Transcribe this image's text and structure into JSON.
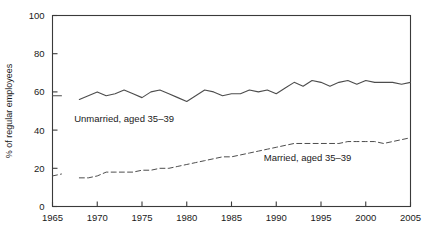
{
  "chart_data": {
    "type": "line",
    "title": "",
    "xlabel": "",
    "ylabel": "% of regular employees",
    "xlim": [
      1965,
      2005
    ],
    "ylim": [
      0,
      100
    ],
    "xticks": [
      1965,
      1970,
      1975,
      1980,
      1985,
      1990,
      1995,
      2000,
      2005
    ],
    "yticks": [
      0,
      20,
      40,
      60,
      80,
      100
    ],
    "grid": false,
    "legend_position": "inline-annotations",
    "annotations": [
      {
        "text": "Unmarried, aged 35–39",
        "x": 1973.0,
        "y": 44.0,
        "series": "unmarried"
      },
      {
        "text": "Married, aged 35–39",
        "x": 1993.5,
        "y": 24.0,
        "series": "married"
      }
    ],
    "series": [
      {
        "name": "Unmarried, aged 35–39",
        "style": "solid",
        "color": "#4d4d4d",
        "x": [
          1965,
          1966,
          1968,
          1969,
          1970,
          1971,
          1972,
          1973,
          1974,
          1975,
          1976,
          1977,
          1978,
          1979,
          1980,
          1981,
          1982,
          1983,
          1984,
          1985,
          1986,
          1987,
          1988,
          1989,
          1990,
          1991,
          1992,
          1993,
          1994,
          1995,
          1996,
          1997,
          1998,
          1999,
          2000,
          2001,
          2002,
          2003,
          2004,
          2005
        ],
        "values": [
          58,
          58,
          56,
          58,
          60,
          58,
          59,
          61,
          59,
          57,
          60,
          61,
          59,
          57,
          55,
          58,
          61,
          60,
          58,
          59,
          59,
          61,
          60,
          61,
          59,
          62,
          65,
          63,
          66,
          65,
          63,
          65,
          66,
          64,
          66,
          65,
          65,
          65,
          64,
          65
        ]
      },
      {
        "name": "Married, aged 35–39",
        "style": "dashed",
        "color": "#4d4d4d",
        "x": [
          1965,
          1966,
          1968,
          1969,
          1970,
          1971,
          1972,
          1973,
          1974,
          1975,
          1976,
          1977,
          1978,
          1979,
          1980,
          1981,
          1982,
          1983,
          1984,
          1985,
          1986,
          1987,
          1988,
          1989,
          1990,
          1991,
          1992,
          1993,
          1994,
          1995,
          1996,
          1997,
          1998,
          1999,
          2000,
          2001,
          2002,
          2003,
          2004,
          2005
        ],
        "values": [
          16,
          17,
          15,
          15,
          16,
          18,
          18,
          18,
          18,
          19,
          19,
          20,
          20,
          21,
          22,
          23,
          24,
          25,
          26,
          26,
          27,
          28,
          29,
          30,
          31,
          32,
          33,
          33,
          33,
          33,
          33,
          33,
          34,
          34,
          34,
          34,
          33,
          34,
          35,
          36
        ]
      }
    ],
    "axis_stub_note": "Each series draws a short segment at the left axis (1965–1966) then resumes in 1968."
  }
}
